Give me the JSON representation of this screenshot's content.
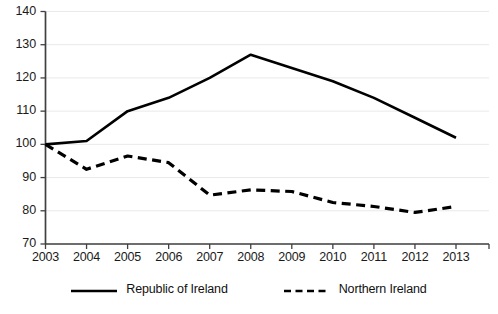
{
  "chart_data": {
    "type": "line",
    "title": "",
    "subtitle": "",
    "xlabel": "",
    "ylabel": "",
    "categories": [
      "2003",
      "2004",
      "2005",
      "2006",
      "2007",
      "2008",
      "2009",
      "2010",
      "2011",
      "2012",
      "2013"
    ],
    "x": [
      2003,
      2004,
      2005,
      2006,
      2007,
      2008,
      2009,
      2010,
      2011,
      2012,
      2013
    ],
    "ylim": [
      70,
      140
    ],
    "yticks": [
      70,
      80,
      90,
      100,
      110,
      120,
      130,
      140
    ],
    "ytick_labels": [
      "70",
      "80",
      "90",
      "100",
      "110",
      "120",
      "130",
      "140"
    ],
    "grid": "horizontal",
    "legend_position": "bottom",
    "series": [
      {
        "name": "Republic of Ireland",
        "style": "solid",
        "color": "#000000",
        "values": [
          100,
          101,
          110,
          114,
          120,
          127,
          123,
          119,
          114,
          108,
          102
        ]
      },
      {
        "name": "Northern Ireland",
        "style": "dashed",
        "color": "#000000",
        "values": [
          100,
          92.5,
          96.5,
          94.5,
          84.7,
          86.3,
          85.8,
          82.5,
          81.3,
          79.5,
          81.3
        ]
      }
    ],
    "annotations": []
  },
  "legend": {
    "items": [
      {
        "label": "Republic of Ireland",
        "swatch": "solid-line-swatch"
      },
      {
        "label": "Northern Ireland",
        "swatch": "dashed-line-swatch"
      }
    ]
  },
  "caption": {
    "text": ""
  }
}
